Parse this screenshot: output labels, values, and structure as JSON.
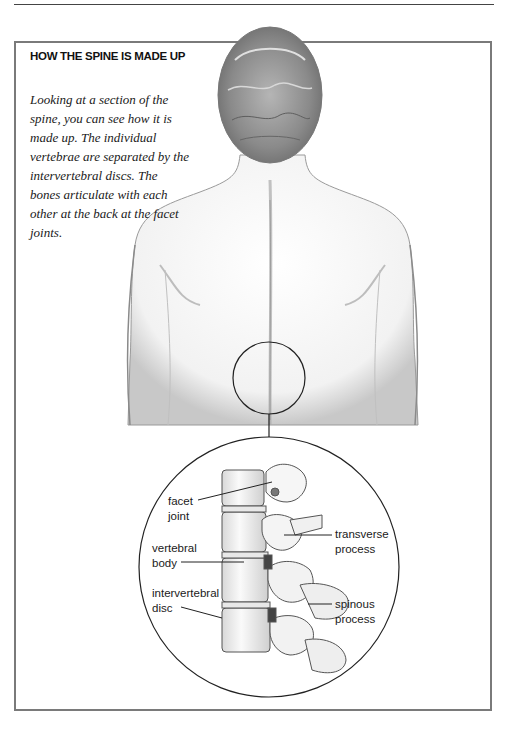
{
  "section": {
    "heading": "HOW THE SPINE IS MADE UP",
    "body": "Looking at a section of the spine, you can see how it is made up. The individual vertebrae are separated by the intervertebral discs. The bones articulate with each other at the back at the facet joints."
  },
  "illustration": {
    "subject": "back-of-human-torso",
    "magnified_subject": "lumbar-spine-section",
    "labels": {
      "facet_joint": [
        "facet",
        "joint"
      ],
      "vertebral_body": [
        "vertebral",
        "body"
      ],
      "intervertebral_disc": [
        "intervertebral",
        "disc"
      ],
      "transverse_process": [
        "transverse",
        "process"
      ],
      "spinous_process": [
        "spinous",
        "process"
      ]
    }
  }
}
